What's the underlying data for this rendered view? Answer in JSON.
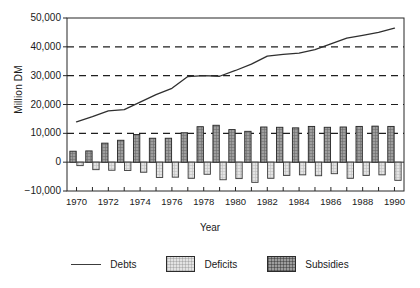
{
  "chart_data": {
    "type": "bar",
    "title": "",
    "xlabel": "Year",
    "ylabel": "Million DM",
    "ylim": [
      -10000,
      50000
    ],
    "xlim": [
      1969.4,
      1990.6
    ],
    "grid": "horizontal dashed gridlines at 10,000 / 20,000 / 30,000 / 40,000",
    "legend_position": "below plot, horizontal",
    "y_ticks": [
      -10000,
      0,
      10000,
      20000,
      30000,
      40000,
      50000
    ],
    "y_tick_labels": [
      "−10,000",
      "0",
      "10,000",
      "20,000",
      "30,000",
      "40,000",
      "50,000"
    ],
    "x_ticks": [
      1970,
      1971,
      1972,
      1973,
      1974,
      1975,
      1976,
      1977,
      1978,
      1979,
      1980,
      1981,
      1982,
      1983,
      1984,
      1985,
      1986,
      1987,
      1988,
      1989,
      1990
    ],
    "x_tick_labels_shown": [
      "1970",
      "1972",
      "1974",
      "1976",
      "1978",
      "1980",
      "1982",
      "1984",
      "1986",
      "1988",
      "1990"
    ],
    "categories": [
      1970,
      1971,
      1972,
      1973,
      1974,
      1975,
      1976,
      1977,
      1978,
      1979,
      1980,
      1981,
      1982,
      1983,
      1984,
      1985,
      1986,
      1987,
      1988,
      1989,
      1990
    ],
    "series": [
      {
        "name": "Debts",
        "render": "line",
        "values": [
          14000,
          15800,
          17800,
          18200,
          20800,
          23400,
          25600,
          29700,
          30000,
          29800,
          31800,
          34000,
          36800,
          37400,
          37800,
          39000,
          41000,
          43000,
          44000,
          45000,
          46500
        ]
      },
      {
        "name": "Deficits",
        "render": "bar",
        "values": [
          -1200,
          -2600,
          -2800,
          -2900,
          -3500,
          -5300,
          -5200,
          -5600,
          -4200,
          -6100,
          -5700,
          -7000,
          -5600,
          -4600,
          -4400,
          -4700,
          -4000,
          -5600,
          -4600,
          -4400,
          -6300
        ]
      },
      {
        "name": "Subsidies",
        "render": "bar",
        "values": [
          3800,
          3900,
          6600,
          7600,
          9600,
          8300,
          8300,
          10200,
          12300,
          12800,
          11300,
          10700,
          12200,
          12100,
          11900,
          12400,
          12100,
          12200,
          12400,
          12500,
          12400
        ]
      }
    ]
  },
  "axes": {
    "ylabel": "Million DM",
    "xlabel": "Year"
  },
  "legend": {
    "items": [
      {
        "label": "Debts",
        "marker": "line",
        "color": "#3c3c3c"
      },
      {
        "label": "Deficits",
        "marker": "swatch",
        "color": "#e3e3e3"
      },
      {
        "label": "Subsidies",
        "marker": "swatch",
        "color": "#9d9d9d"
      }
    ]
  }
}
